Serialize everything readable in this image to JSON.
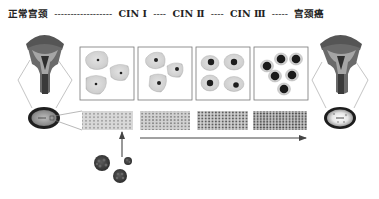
{
  "header": {
    "title_text": "正常宫颈 -------------- CIN Ⅰ ----- CIN Ⅱ ----- CIN Ⅲ ------ 宫颈癌",
    "stages": [
      {
        "label": "正常宫颈"
      },
      {
        "label": "CIN Ⅰ"
      },
      {
        "label": "CIN Ⅱ"
      },
      {
        "label": "CIN Ⅲ"
      },
      {
        "label": "宫颈癌"
      }
    ]
  },
  "diagram": {
    "left_organ": "normal-cervix",
    "right_organ": "cervical-cancer",
    "cell_panels": [
      {
        "name": "normal",
        "cells": 3,
        "nucleus_size": "small"
      },
      {
        "name": "cin1",
        "cells": 3,
        "nucleus_size": "small-medium"
      },
      {
        "name": "cin2",
        "cells": 4,
        "nucleus_size": "medium"
      },
      {
        "name": "cin3",
        "cells": 6,
        "nucleus_size": "large"
      }
    ],
    "tissue_strips": 4,
    "progression_arrow": "left-to-right",
    "virus_particles": 3,
    "colors": {
      "organ_dark": "#3a3a3a",
      "organ_mid": "#8a8a8a",
      "cell_fill": "#d0d0d0",
      "nucleus": "#1e1e1e",
      "box_border": "#777777"
    }
  }
}
